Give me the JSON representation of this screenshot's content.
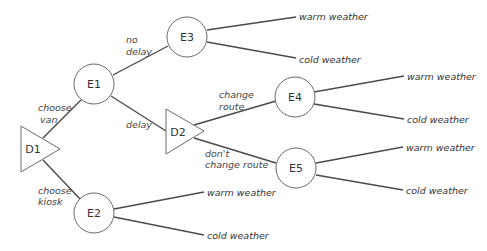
{
  "diagram": {
    "type": "decision-tree",
    "nodes": {
      "D1": {
        "label": "D1",
        "shape": "triangle"
      },
      "E1": {
        "label": "E1",
        "shape": "circle"
      },
      "E2": {
        "label": "E2",
        "shape": "circle"
      },
      "E3": {
        "label": "E3",
        "shape": "circle"
      },
      "D2": {
        "label": "D2",
        "shape": "triangle"
      },
      "E4": {
        "label": "E4",
        "shape": "circle"
      },
      "E5": {
        "label": "E5",
        "shape": "circle"
      }
    },
    "edges": {
      "choose_van": {
        "line1": "choose",
        "line2": "van"
      },
      "choose_kiosk": {
        "line1": "choose",
        "line2": "kiosk"
      },
      "no_delay": {
        "line1": "no",
        "line2": "delay"
      },
      "delay": {
        "line1": "delay"
      },
      "change_route": {
        "line1": "change",
        "line2": "route"
      },
      "dont_change_route": {
        "line1": "don't",
        "line2": "change route"
      }
    },
    "leaves": {
      "e3_warm": "warm weather",
      "e3_cold": "cold weather",
      "e4_warm": "warm weather",
      "e4_cold": "cold weather",
      "e5_warm": "warm weather",
      "e5_cold": "cold weather",
      "e2_warm": "warm weather",
      "e2_cold": "cold weather"
    }
  }
}
